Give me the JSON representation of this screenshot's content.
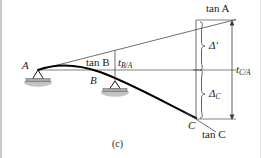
{
  "figure": {
    "caption": "(c)",
    "type": "beam-deflection-moment-area-diagram"
  },
  "labels": {
    "point_a": "A",
    "point_b": "B",
    "point_c": "C",
    "tan_a": "tan A",
    "tan_b": "tan B",
    "tan_c": "tan C",
    "t_ba_main": "t",
    "t_ba_sub": "B/A",
    "t_ca_main": "t",
    "t_ca_sub": "C/A",
    "delta_prime": "Δ'",
    "delta_c_main": "Δ",
    "delta_c_sub": "C"
  },
  "colors": {
    "ink": "#1a1a1a",
    "curve": "#000000",
    "thin_line": "#4a4a4a",
    "support_fill": "#b9b9b9",
    "background": "#ffffff",
    "frame": "#c9c9c9"
  },
  "geometry": {
    "point_a": [
      38,
      70
    ],
    "point_b": [
      115,
      81
    ],
    "point_c": [
      196,
      118
    ],
    "tan_a_end": [
      232,
      20
    ],
    "dim_line_x": 232,
    "brace_x": 205
  }
}
